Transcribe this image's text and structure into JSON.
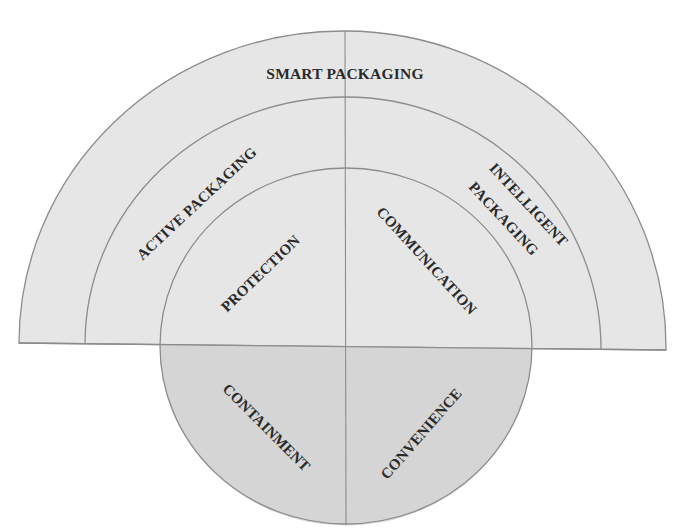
{
  "diagram": {
    "colors": {
      "background": "#ffffff",
      "upper_fill": "#e6e6e6",
      "lower_fill": "#d5d5d5",
      "stroke": "#8c8c8c",
      "text": "#2a2a2a"
    },
    "outer_ring": {
      "label": "SMART PACKAGING"
    },
    "middle_ring": {
      "left_label": "ACTIVE PACKAGING",
      "right_label_line1": "INTELLIGENT",
      "right_label_line2": "PACKAGING"
    },
    "inner_circle": {
      "quadrants": {
        "top_left": "PROTECTION",
        "top_right": "COMMUNICATION",
        "bottom_left": "CONTAINMENT",
        "bottom_right": "CONVENIENCE"
      }
    }
  }
}
